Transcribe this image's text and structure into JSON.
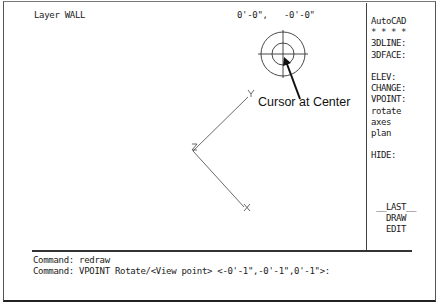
{
  "status_bar": {
    "layer": "Layer WALL",
    "coord_x": "0'-0\",",
    "coord_y": "-0'-0\""
  },
  "side_menu": {
    "items": [
      {
        "label": "AutoCAD"
      },
      {
        "label": "* * * *"
      },
      {
        "label": "3DLINE:"
      },
      {
        "label": "3DFACE:"
      },
      {
        "label": ""
      },
      {
        "label": "ELEV:"
      },
      {
        "label": "CHANGE:"
      },
      {
        "label": "VPOINT:"
      },
      {
        "label": "rotate"
      },
      {
        "label": "axes"
      },
      {
        "label": "plan"
      },
      {
        "label": ""
      },
      {
        "label": "HIDE:"
      }
    ],
    "bottom_items": [
      {
        "label": "__LAST__"
      },
      {
        "label": "DRAW"
      },
      {
        "label": "EDIT"
      }
    ]
  },
  "drawing": {
    "axis_labels": {
      "x": "X",
      "y": "Y",
      "z": "Z"
    },
    "annotation": "Cursor at Center",
    "icons": [
      "compass-globe-icon",
      "axis-tripod-icon"
    ]
  },
  "command_area": {
    "lines": [
      "Command: redraw",
      "Command: VPOINT Rotate/<View point> <-0'-1\",-0'-1\",0'-1\">:"
    ]
  }
}
